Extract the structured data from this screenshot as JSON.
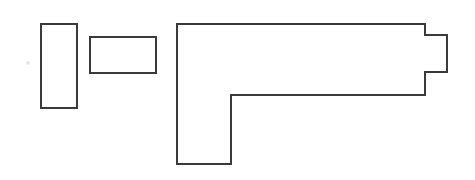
{
  "canvas": {
    "width": 475,
    "height": 180,
    "background_color": "#ffffff",
    "title": "Line drawing of three outlined shapes"
  },
  "style": {
    "stroke_color": "#3a3a3a",
    "stroke_width": 2,
    "fill_color": "#ffffff",
    "speck_color": "#e2e2e2"
  },
  "shapes": [
    {
      "id": "tall-rectangle",
      "label": "Tall vertical rectangle",
      "type": "rect",
      "x": 41,
      "y": 24,
      "width": 36,
      "height": 84
    },
    {
      "id": "small-rectangle",
      "label": "Small horizontal rectangle",
      "type": "rect",
      "x": 90,
      "y": 37,
      "width": 66,
      "height": 36
    },
    {
      "id": "notched-l-shape",
      "label": "Large L-shaped polygon with right-side tab",
      "type": "polygon",
      "points": "177,24 425,24 425,35 447,35 447,72 425,72 425,95 231,95 231,164 177,164"
    }
  ],
  "artifacts": [
    {
      "id": "faint-speck",
      "label": "Faint gray speck",
      "cx": 28,
      "cy": 63,
      "r": 1.6
    }
  ]
}
